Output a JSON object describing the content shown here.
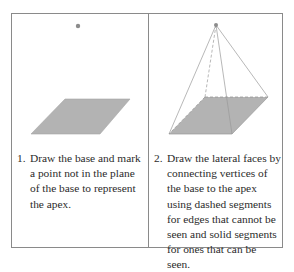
{
  "diagram": {
    "colors": {
      "frame": "#8a8a8a",
      "base_fill": "#b3b3b3",
      "edge": "#9a9a9a",
      "apex": "#8c8c8c",
      "text": "#2b2b2b"
    },
    "panels": [
      {
        "step_number": "1.",
        "text": "Draw the base and mark a point not in the plane of the base to represent the apex.",
        "figure": {
          "apex": [
            78,
            26
          ],
          "base": [
            [
              65,
              99
            ],
            [
              130,
              99
            ],
            [
              100,
              134
            ],
            [
              31,
              134
            ]
          ]
        }
      },
      {
        "step_number": "2.",
        "text": "Draw the lateral faces by connecting vertices of the base to the apex using dashed segments for edges that cannot be seen and solid segments for ones that can be seen.",
        "figure": {
          "apex": [
            216,
            25
          ],
          "base": [
            [
              205,
              97
            ],
            [
              268,
              97
            ],
            [
              232,
              134
            ],
            [
              169,
              134
            ]
          ],
          "hidden_edges": [
            "apex-back-left",
            "back-left-back-right",
            "back-left-front-left"
          ],
          "visible_edges": [
            "apex-back-right",
            "apex-front-right",
            "apex-front-left"
          ]
        }
      }
    ]
  }
}
